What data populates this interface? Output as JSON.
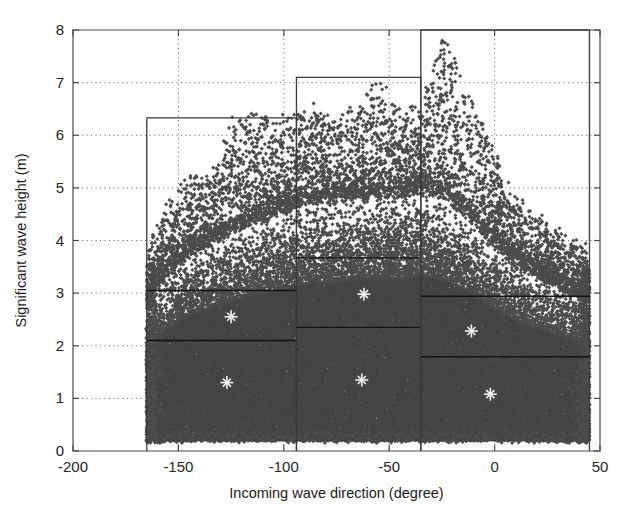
{
  "figure": {
    "background": "#ffffff",
    "point_color": "#4c4c4c",
    "box_color": "#3a3a3a",
    "centroid_color": "#f2f2f2",
    "grid_color": "#6b6b6b"
  },
  "chart_data": {
    "type": "scatter",
    "title": "",
    "xlabel": "Incoming wave direction (degree)",
    "ylabel": "Significant wave height (m)",
    "xlim": [
      -200,
      50
    ],
    "ylim": [
      0,
      8
    ],
    "xticks": [
      -200,
      -150,
      -100,
      -50,
      0,
      50
    ],
    "xticklabels": [
      "-200",
      "-150",
      "-100",
      "-50",
      "0",
      "50"
    ],
    "yticks": [
      0,
      1,
      2,
      3,
      4,
      5,
      6,
      7,
      8
    ],
    "yticklabels": [
      "0",
      "1",
      "2",
      "3",
      "4",
      "5",
      "6",
      "7",
      "8"
    ],
    "grid": true,
    "grid_style": "dotted",
    "legend": "none",
    "marker": "diamond",
    "marker_size": 3,
    "n_points_approx": 9000,
    "data_extent": {
      "x_min": -165,
      "x_max": 45,
      "y_min": 0.15,
      "y_max": 8.0,
      "dense_below": 3.0,
      "peak_direction": -30
    },
    "density_profile": {
      "comment": "Upper envelope of the scatter cloud: max significant wave height observed per direction bin",
      "direction": [
        -165,
        -155,
        -145,
        -135,
        -125,
        -115,
        -105,
        -95,
        -85,
        -75,
        -65,
        -55,
        -45,
        -35,
        -25,
        -15,
        -5,
        5,
        15,
        25,
        35,
        45
      ],
      "max_height": [
        3.8,
        4.7,
        5.2,
        5.2,
        6.25,
        6.35,
        6.35,
        6.35,
        6.5,
        6.3,
        6.5,
        7.1,
        6.5,
        6.5,
        8.0,
        7.0,
        6.2,
        5.1,
        4.6,
        4.3,
        4.0,
        3.85
      ],
      "bulk_top": [
        2.9,
        3.4,
        3.8,
        4.0,
        4.2,
        4.4,
        4.5,
        4.7,
        4.8,
        4.8,
        4.9,
        4.9,
        4.9,
        5.0,
        4.9,
        4.6,
        4.2,
        3.8,
        3.5,
        3.3,
        3.1,
        3.0
      ]
    },
    "partition_boxes": [
      {
        "id": "sector-west",
        "x_range": [
          -165,
          -94
        ],
        "y_top": 6.33,
        "y_dividers": [
          3.05,
          2.1
        ],
        "centroids": [
          {
            "x": -125,
            "y": 2.55
          },
          {
            "x": -127,
            "y": 1.3
          }
        ]
      },
      {
        "id": "sector-southwest",
        "x_range": [
          -94,
          -35
        ],
        "y_top": 7.1,
        "y_dividers": [
          3.67,
          2.35
        ],
        "centroids": [
          {
            "x": -62,
            "y": 2.98
          },
          {
            "x": -63,
            "y": 1.35
          }
        ]
      },
      {
        "id": "sector-south",
        "x_range": [
          -35,
          45
        ],
        "y_top": 8.0,
        "y_dividers": [
          2.94,
          1.79
        ],
        "centroids": [
          {
            "x": -11,
            "y": 2.28
          },
          {
            "x": -2,
            "y": 1.08
          }
        ]
      }
    ]
  }
}
